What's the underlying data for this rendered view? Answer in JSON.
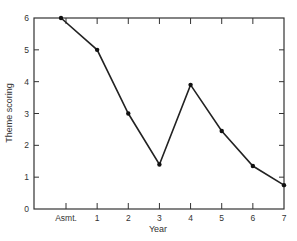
{
  "header": {
    "cutoff_text": ""
  },
  "chart_data": {
    "type": "line",
    "title": "",
    "xlabel": "Year",
    "ylabel": "Theme scoring",
    "categories": [
      "Asmt.",
      "1",
      "2",
      "3",
      "4",
      "5",
      "6",
      "7"
    ],
    "series": [
      {
        "name": "Theme scoring",
        "values": [
          6.0,
          5.0,
          3.0,
          1.4,
          3.9,
          2.45,
          1.35,
          0.75
        ]
      }
    ],
    "ylim": [
      0,
      6
    ],
    "yticks": [
      "0",
      "1",
      "2",
      "3",
      "4",
      "5",
      "6"
    ],
    "grid": false,
    "legend": null,
    "colors": {
      "line": "#222222",
      "axis": "#333333",
      "marker": "#111111"
    }
  }
}
